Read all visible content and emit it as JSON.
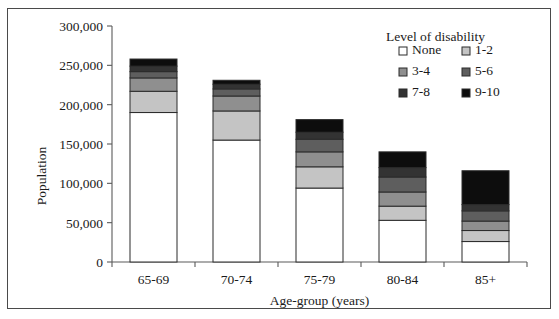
{
  "chart_data": {
    "type": "bar",
    "subtype": "stacked-vertical",
    "title": "",
    "xlabel": "Age-group (years)",
    "ylabel": "Population",
    "categories": [
      "65-69",
      "70-74",
      "75-79",
      "80-84",
      "85+"
    ],
    "ylim": [
      0,
      300000
    ],
    "yticks": [
      0,
      50000,
      100000,
      150000,
      200000,
      250000,
      300000
    ],
    "ytick_labels": [
      "0",
      "50,000",
      "100,000",
      "150,000",
      "200,000",
      "250,000",
      "300,000"
    ],
    "grid": false,
    "legend_position": "upper right",
    "legend_title": "Level of disability",
    "series": [
      {
        "name": "None",
        "color": "#ffffff",
        "values": [
          190000,
          155000,
          94000,
          53000,
          26000
        ]
      },
      {
        "name": "1-2",
        "color": "#c4c4c4",
        "values": [
          27000,
          37000,
          27000,
          18000,
          14000
        ]
      },
      {
        "name": "3-4",
        "color": "#8f8f8f",
        "values": [
          17000,
          19000,
          19000,
          18000,
          12000
        ]
      },
      {
        "name": "5-6",
        "color": "#5e5e5e",
        "values": [
          8000,
          9000,
          16000,
          19000,
          13000
        ]
      },
      {
        "name": "7-8",
        "color": "#333333",
        "values": [
          7000,
          6000,
          9000,
          12000,
          8000
        ]
      },
      {
        "name": "9-10",
        "color": "#0d0d0d",
        "values": [
          9000,
          5000,
          16000,
          20000,
          43000
        ]
      }
    ],
    "totals": [
      258000,
      231000,
      181000,
      140000,
      116000
    ],
    "annotations": []
  },
  "legend": {
    "title": "Level of disability",
    "entries": [
      {
        "label": "None",
        "swatch": "#ffffff"
      },
      {
        "label": "1-2",
        "swatch": "#c4c4c4"
      },
      {
        "label": "3-4",
        "swatch": "#8f8f8f"
      },
      {
        "label": "5-6",
        "swatch": "#5e5e5e"
      },
      {
        "label": "7-8",
        "swatch": "#333333"
      },
      {
        "label": "9-10",
        "swatch": "#0d0d0d"
      }
    ]
  },
  "axes": {
    "y_title": "Population",
    "x_title": "Age-group (years)"
  },
  "colors": {
    "frame": "#4a4a4a",
    "axis": "#5a5a5a",
    "bar_outline": "#2b2b2b",
    "text": "#1a1a1a",
    "background": "#ffffff"
  }
}
